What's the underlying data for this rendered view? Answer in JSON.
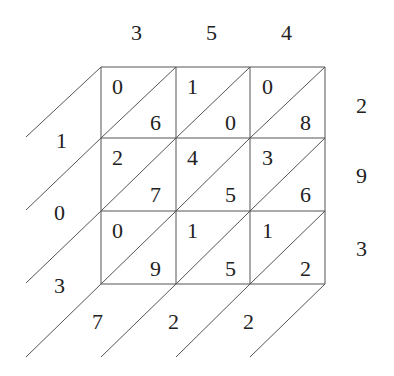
{
  "multiplicand_digits": [
    "3",
    "5",
    "4"
  ],
  "multiplier_digits": [
    "2",
    "9",
    "3"
  ],
  "cells": [
    [
      {
        "tens": "0",
        "ones": "6"
      },
      {
        "tens": "1",
        "ones": "0"
      },
      {
        "tens": "0",
        "ones": "8"
      }
    ],
    [
      {
        "tens": "2",
        "ones": "7"
      },
      {
        "tens": "4",
        "ones": "5"
      },
      {
        "tens": "3",
        "ones": "6"
      }
    ],
    [
      {
        "tens": "0",
        "ones": "9"
      },
      {
        "tens": "1",
        "ones": "5"
      },
      {
        "tens": "1",
        "ones": "2"
      }
    ]
  ],
  "result_left_digits": [
    "1",
    "0",
    "3"
  ],
  "result_bottom_digits": [
    "7",
    "2",
    "2"
  ],
  "colors": {
    "line": "#555555",
    "text": "#222222",
    "background": "#ffffff"
  }
}
